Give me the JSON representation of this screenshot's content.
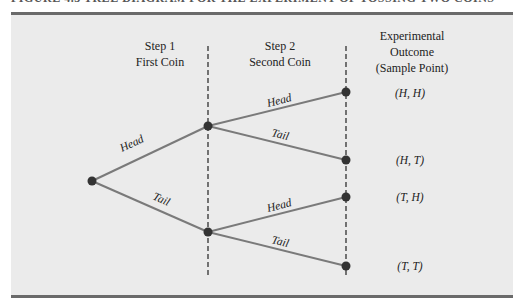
{
  "figure": {
    "caption": "FIGURE 4.3  TREE DIAGRAM FOR THE EXPERIMENT OF TOSSING TWO COINS",
    "colors": {
      "panel_bg": "#ebebeb",
      "rule": "#6a6a6a",
      "branch": "#7a7a7a",
      "node": "#333333",
      "divider": "#222222"
    }
  },
  "headers": {
    "step1": {
      "line1": "Step 1",
      "line2": "First Coin"
    },
    "step2": {
      "line1": "Step 2",
      "line2": "Second Coin"
    },
    "outcome": {
      "line1": "Experimental",
      "line2": "Outcome",
      "line3": "(Sample Point)"
    }
  },
  "branches": {
    "first_head": "Head",
    "first_tail": "Tail",
    "second_hh": "Head",
    "second_ht": "Tail",
    "second_th": "Head",
    "second_tt": "Tail"
  },
  "outcomes": [
    "(H, H)",
    "(H, T)",
    "(T, H)",
    "(T, T)"
  ]
}
